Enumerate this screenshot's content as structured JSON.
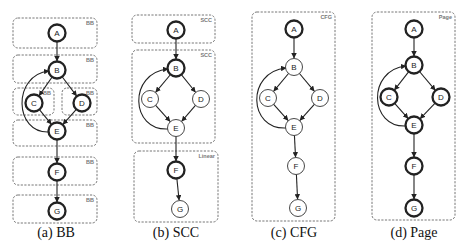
{
  "figure": {
    "panels": [
      {
        "id": "a",
        "caption": "(a) BB",
        "caption_x": 56,
        "thick_nodes": [
          "A",
          "B",
          "C",
          "D",
          "E",
          "F",
          "G"
        ],
        "nodes": {
          "A": [
            57,
            33
          ],
          "B": [
            57,
            70
          ],
          "C": [
            34,
            103
          ],
          "D": [
            82,
            103
          ],
          "E": [
            57,
            131
          ],
          "F": [
            57,
            172
          ],
          "G": [
            57,
            211
          ]
        },
        "boxes": [
          {
            "label": "BB",
            "x": 13,
            "y": 18,
            "w": 84,
            "h": 30
          },
          {
            "label": "BB",
            "x": 13,
            "y": 55,
            "w": 84,
            "h": 28
          },
          {
            "label": "BB",
            "x": 13,
            "y": 88,
            "w": 41,
            "h": 27
          },
          {
            "label": "BB",
            "x": 62,
            "y": 88,
            "w": 35,
            "h": 27
          },
          {
            "label": "BB",
            "x": 13,
            "y": 120,
            "w": 84,
            "h": 26
          },
          {
            "label": "BB",
            "x": 13,
            "y": 157,
            "w": 84,
            "h": 28
          },
          {
            "label": "BB",
            "x": 13,
            "y": 195,
            "w": 84,
            "h": 28
          }
        ]
      },
      {
        "id": "b",
        "caption": "(b) SCC",
        "caption_x": 176,
        "thick_nodes": [
          "A",
          "B",
          "F"
        ],
        "nodes": {
          "A": [
            176,
            30
          ],
          "B": [
            176,
            68
          ],
          "C": [
            150,
            99
          ],
          "D": [
            201,
            99
          ],
          "E": [
            176,
            128
          ],
          "F": [
            176,
            170
          ],
          "G": [
            180,
            209
          ]
        },
        "boxes": [
          {
            "label": "SCC",
            "x": 132,
            "y": 15,
            "w": 83,
            "h": 28
          },
          {
            "label": "SCC",
            "x": 132,
            "y": 50,
            "w": 83,
            "h": 93
          },
          {
            "label": "Linear",
            "x": 134,
            "y": 151,
            "w": 84,
            "h": 71
          }
        ]
      },
      {
        "id": "c",
        "caption": "(c) CFG",
        "caption_x": 294,
        "thick_nodes": [
          "A"
        ],
        "nodes": {
          "A": [
            294,
            29
          ],
          "B": [
            294,
            67
          ],
          "C": [
            268,
            98
          ],
          "D": [
            320,
            98
          ],
          "E": [
            294,
            127
          ],
          "F": [
            296,
            166
          ],
          "G": [
            298,
            208
          ]
        },
        "boxes": [
          {
            "label": "CFG",
            "x": 252,
            "y": 12,
            "w": 83,
            "h": 209
          }
        ]
      },
      {
        "id": "d",
        "caption": "(d) Page",
        "caption_x": 414,
        "thick_nodes": [
          "A",
          "B",
          "C",
          "D",
          "E",
          "F",
          "G"
        ],
        "nodes": {
          "A": [
            414,
            29
          ],
          "B": [
            414,
            65
          ],
          "C": [
            389,
            97
          ],
          "D": [
            441,
            97
          ],
          "E": [
            414,
            125
          ],
          "F": [
            414,
            166
          ],
          "G": [
            414,
            208
          ]
        },
        "boxes": [
          {
            "label": "Page",
            "x": 372,
            "y": 12,
            "w": 83,
            "h": 208
          }
        ]
      }
    ],
    "edges": [
      [
        "A",
        "B"
      ],
      [
        "B",
        "C"
      ],
      [
        "B",
        "D"
      ],
      [
        "C",
        "E"
      ],
      [
        "D",
        "E"
      ],
      [
        "E",
        "F"
      ],
      [
        "F",
        "G"
      ]
    ],
    "back_edges": [
      [
        "E",
        "B"
      ]
    ],
    "node_radius": 8.5,
    "colors": {
      "node_stroke": "#222222",
      "box_stroke": "#666666",
      "tag_text": "#777777",
      "background": "#ffffff"
    }
  }
}
